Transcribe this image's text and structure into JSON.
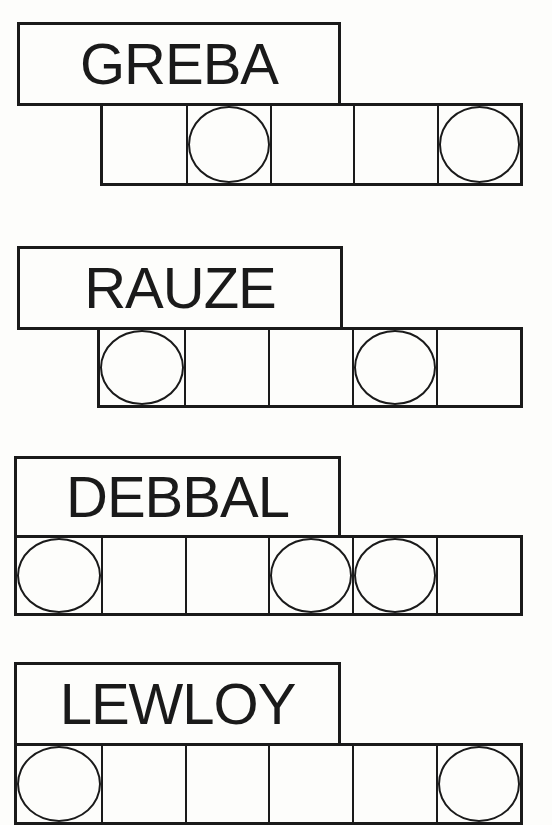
{
  "puzzles": [
    {
      "scrambled": "GREBA",
      "box": {
        "x": 17,
        "y": 22,
        "w": 324,
        "h": 84
      },
      "cells": {
        "x": 100,
        "y": 103,
        "w": 423,
        "h": 83
      },
      "count": 5,
      "circled": [
        2,
        5
      ]
    },
    {
      "scrambled": "RAUZE",
      "box": {
        "x": 17,
        "y": 246,
        "w": 326,
        "h": 84
      },
      "cells": {
        "x": 97,
        "y": 327,
        "w": 426,
        "h": 81
      },
      "count": 5,
      "circled": [
        1,
        4
      ]
    },
    {
      "scrambled": "DEBBAL",
      "box": {
        "x": 14,
        "y": 456,
        "w": 327,
        "h": 82
      },
      "cells": {
        "x": 14,
        "y": 535,
        "w": 509,
        "h": 81
      },
      "count": 6,
      "circled": [
        1,
        4,
        5
      ]
    },
    {
      "scrambled": "LEWLOY",
      "box": {
        "x": 14,
        "y": 662,
        "w": 327,
        "h": 84
      },
      "cells": {
        "x": 14,
        "y": 743,
        "w": 509,
        "h": 82
      },
      "count": 6,
      "circled": [
        1,
        6
      ]
    }
  ]
}
